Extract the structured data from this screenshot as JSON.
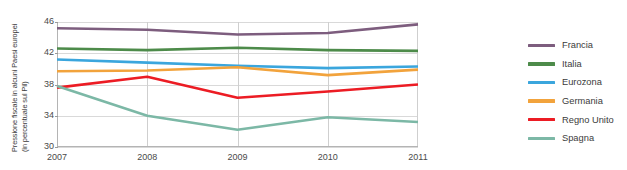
{
  "chart_data": {
    "type": "line",
    "title": "",
    "subtitle": "",
    "xlabel": "",
    "ylabel": "Pressione fiscale in alcuni Paesi europei\n(in percentuale sul Pil)",
    "x": [
      2007,
      2008,
      2009,
      2010,
      2011
    ],
    "xtick_labels": [
      "2007",
      "2008",
      "2009",
      "2010",
      "2011"
    ],
    "ytick_labels": [
      "46",
      "42",
      "38",
      "34",
      "30"
    ],
    "yticks": [
      46,
      42,
      38,
      34,
      30
    ],
    "ylim": [
      30,
      46
    ],
    "xlim": [
      2007,
      2011
    ],
    "grid": "horizontal-and-vertical",
    "legend_position": "right",
    "series": [
      {
        "name": "Francia",
        "color": "#7d5d7e",
        "values": [
          45.2,
          45.0,
          44.4,
          44.6,
          45.7
        ]
      },
      {
        "name": "Italia",
        "color": "#4d8b4a",
        "values": [
          42.6,
          42.4,
          42.7,
          42.4,
          42.3
        ]
      },
      {
        "name": "Eurozona",
        "color": "#3ba6dd",
        "values": [
          41.2,
          40.8,
          40.4,
          40.1,
          40.3
        ]
      },
      {
        "name": "Germania",
        "color": "#f2a33c",
        "values": [
          39.7,
          39.8,
          40.2,
          39.2,
          39.9
        ]
      },
      {
        "name": "Regno Unito",
        "color": "#ec1c24",
        "values": [
          37.6,
          39.0,
          36.3,
          37.1,
          38.0
        ]
      },
      {
        "name": "Spagna",
        "color": "#7cb8a6",
        "values": [
          37.8,
          34.0,
          32.2,
          33.8,
          33.2
        ]
      }
    ]
  },
  "legend": {
    "items": [
      {
        "label": "Francia"
      },
      {
        "label": "Italia"
      },
      {
        "label": "Eurozona"
      },
      {
        "label": "Germania"
      },
      {
        "label": "Regno Unito"
      },
      {
        "label": "Spagna"
      }
    ]
  },
  "colors": {
    "francia": "#7d5d7e",
    "italia": "#4d8b4a",
    "eurozona": "#3ba6dd",
    "germania": "#f2a33c",
    "regno_unito": "#ec1c24",
    "spagna": "#7cb8a6",
    "grid": "#d9d9d9",
    "axis": "#b4b4b4",
    "text": "#3b3b3b",
    "background": "#ffffff"
  }
}
